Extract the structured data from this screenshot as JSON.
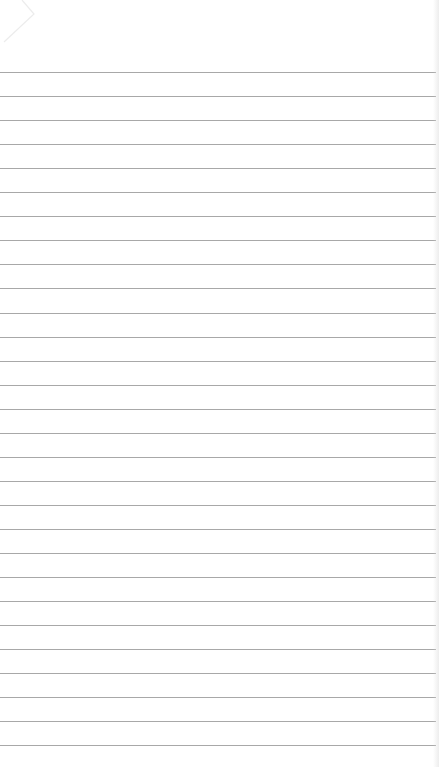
{
  "image": {
    "description": "Blank lined notepad paper",
    "background_color": "#ffffff",
    "line_color": "#a8a8a8"
  },
  "rules": {
    "first_y": 72,
    "spacing": 24.05,
    "count": 29,
    "width": 436
  }
}
